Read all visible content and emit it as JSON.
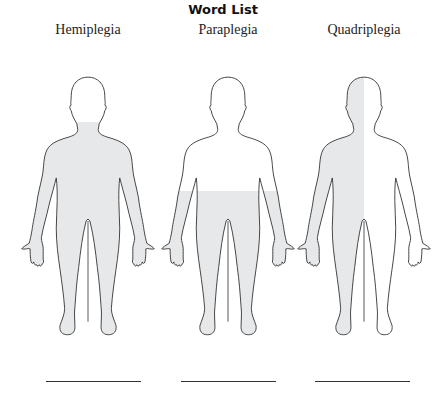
{
  "title": "Word List",
  "figures": [
    {
      "label": "Hemiplegia",
      "shading": "neck-down",
      "center_x": 88
    },
    {
      "label": "Paraplegia",
      "shading": "waist-down",
      "center_x": 228
    },
    {
      "label": "Quadriplegia",
      "shading": "left-half",
      "center_x": 364
    }
  ],
  "colors": {
    "outline": "#3a3a3a",
    "shade": "#e6e8ea",
    "background": "#ffffff"
  },
  "answer_lines": [
    {
      "value": ""
    },
    {
      "value": ""
    },
    {
      "value": ""
    }
  ]
}
